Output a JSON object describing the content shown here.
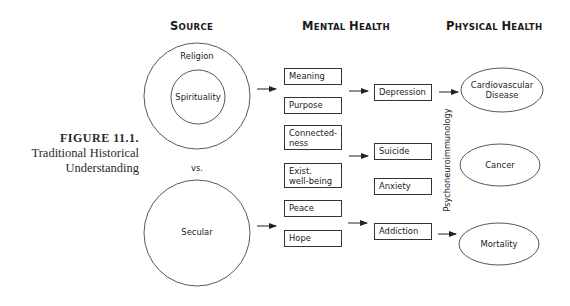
{
  "figure": {
    "number_label": "FIGURE 11.1.",
    "caption_line1": "Traditional Historical",
    "caption_line2": "Understanding"
  },
  "columns": {
    "source": {
      "first": "S",
      "rest": "OURCE"
    },
    "mental": {
      "first1": "M",
      "rest1": "ENTAL ",
      "first2": "H",
      "rest2": "EALTH"
    },
    "physical": {
      "first1": "P",
      "rest1": "HYSICAL ",
      "first2": "H",
      "rest2": "EALTH"
    }
  },
  "source": {
    "religion": "Religion",
    "spirituality": "Spirituality",
    "versus": "vs.",
    "secular": "Secular"
  },
  "mediators": [
    {
      "line1": "Meaning",
      "line2": ""
    },
    {
      "line1": "Purpose",
      "line2": ""
    },
    {
      "line1": "Connected-",
      "line2": "ness"
    },
    {
      "line1": "Exist.",
      "line2": "well-being"
    },
    {
      "line1": "Peace",
      "line2": ""
    },
    {
      "line1": "Hope",
      "line2": ""
    }
  ],
  "mental_outcomes": [
    "Depression",
    "Suicide",
    "Anxiety",
    "Addiction"
  ],
  "pathway_label": "Psychoneuroimmunology",
  "physical_outcomes": [
    {
      "line1": "Cardiovascular",
      "line2": "Disease"
    },
    {
      "line1": "Cancer",
      "line2": ""
    },
    {
      "line1": "Mortality",
      "line2": ""
    }
  ],
  "colors": {
    "stroke": "#333333",
    "text": "#222222",
    "background": "#ffffff"
  }
}
